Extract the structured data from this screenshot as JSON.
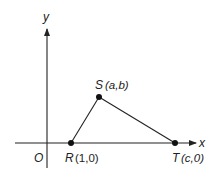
{
  "diagram": {
    "axes": {
      "x_label": "x",
      "y_label": "y",
      "origin_label": "O"
    },
    "points": [
      {
        "name": "R",
        "coords": "(1,0)"
      },
      {
        "name": "S",
        "coords": "(a,b)"
      },
      {
        "name": "T",
        "coords": "(c,0)"
      }
    ],
    "segments": [
      "RS",
      "ST"
    ],
    "colors": {
      "stroke": "#222222",
      "background": "#ffffff"
    }
  }
}
